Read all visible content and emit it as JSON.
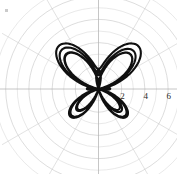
{
  "figure": {
    "kind": "polar-plot",
    "background_color": "#ffffff",
    "curve_color": "#101010",
    "grid_color": "#cccccc",
    "axis_color": "#b0b0b0",
    "curve_line_width": 2.1,
    "grid_line_width": 0.7
  },
  "axis": {
    "tick_labels": [
      "2",
      "4",
      "6"
    ],
    "tick_values": [
      2,
      4,
      6
    ],
    "radial_label_angle_deg": 0
  },
  "chart_data": {
    "type": "line",
    "title": "",
    "subtitle": "",
    "xlabel": "",
    "ylabel": "",
    "projection": "polar",
    "grid": true,
    "legend": false,
    "legend_position": "none",
    "radial_ticks": [
      2,
      4,
      6
    ],
    "radial_tick_labels": [
      "2",
      "4",
      "6"
    ],
    "rlim": [
      0,
      7
    ],
    "angular_grid_deg": [
      0,
      30,
      60,
      90,
      120,
      150,
      180,
      210,
      240,
      270,
      300,
      330
    ],
    "series": [
      {
        "name": "butterfly curve",
        "equation": "r = e^(sin t) - 2*cos(4t) + sin((2t-pi)/24)^5",
        "theta_units": "radians",
        "theta_range": [
          0,
          25.132741228718345
        ],
        "n_points": 720,
        "notes": "Classic Temple H. Fay butterfly curve rendered in polar coordinates; four large lobes toward the diagonals plus small central petals.",
        "sample_points_polar": [
          {
            "theta_deg": 0,
            "r": -1.0
          },
          {
            "theta_deg": 15,
            "r": 0.877
          },
          {
            "theta_deg": 30,
            "r": 2.508
          },
          {
            "theta_deg": 45,
            "r": 3.193
          },
          {
            "theta_deg": 60,
            "r": 3.366
          },
          {
            "theta_deg": 75,
            "r": 3.367
          },
          {
            "theta_deg": 90,
            "r": 0.718
          },
          {
            "theta_deg": 105,
            "r": 0.634
          },
          {
            "theta_deg": 120,
            "r": 3.098
          },
          {
            "theta_deg": 135,
            "r": 3.126
          },
          {
            "theta_deg": 150,
            "r": 2.46
          },
          {
            "theta_deg": 165,
            "r": 0.825
          },
          {
            "theta_deg": 180,
            "r": -1.0
          },
          {
            "theta_deg": 210,
            "r": -0.209
          },
          {
            "theta_deg": 225,
            "r": 0.525
          },
          {
            "theta_deg": 240,
            "r": 0.754
          },
          {
            "theta_deg": 270,
            "r": -1.632
          },
          {
            "theta_deg": 300,
            "r": 0.753
          },
          {
            "theta_deg": 330,
            "r": -0.211
          },
          {
            "theta_deg": 360,
            "r": -1.0
          }
        ]
      }
    ]
  }
}
